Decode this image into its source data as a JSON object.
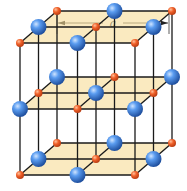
{
  "dimension": {
    "label": "a",
    "x1": 57,
    "x2": 169,
    "y": 23,
    "tick_top": 10,
    "tick_bottom": 34
  },
  "colors": {
    "large_ion": "#3b7fd8",
    "large_ion_dark": "#1f4f9e",
    "small_ion": "#f0612a",
    "small_ion_dark": "#c0441a",
    "plane_fill": "#f6dc96",
    "bond": "#1a1a1a"
  },
  "projection": {
    "origin": [
      20,
      175
    ],
    "x_vec": [
      115,
      0
    ],
    "y_vec": [
      37,
      -32
    ],
    "z_vec": [
      0,
      -132
    ]
  },
  "lattice": {
    "size": 2,
    "small_ion_radius": 4,
    "large_ion_radius": 8,
    "plane_levels": [
      0,
      1,
      2
    ]
  }
}
